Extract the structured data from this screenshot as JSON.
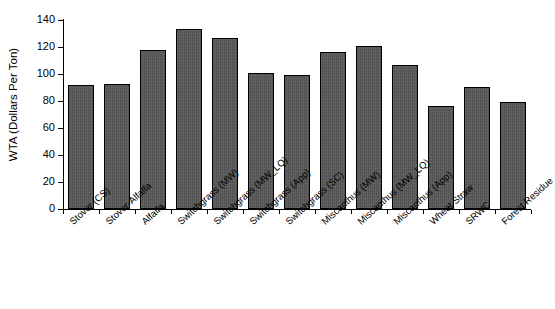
{
  "chart_data": {
    "type": "bar",
    "title": "",
    "xlabel": "",
    "ylabel": "WTA (Dollars Per Ton)",
    "ylim": [
      0,
      140
    ],
    "ytick_values": [
      0,
      20,
      40,
      60,
      80,
      100,
      120,
      140
    ],
    "ytick_labels": [
      "0",
      "20",
      "40",
      "60",
      "80",
      "100",
      "120",
      "140"
    ],
    "grid": false,
    "legend": null,
    "bar_color": "#585858",
    "bar_border_color": "#000000",
    "axis_color": "#000000",
    "categories": [
      "Stover (CS)",
      "Stover-Alfalfa",
      "Alfalfa",
      "Switchgrass (MW)",
      "Switchgrass (MW_LQ)",
      "Switchgrass (App)",
      "Switchgrass (SC)",
      "Miscanthus (MW)",
      "Miscanthus (MW_LQ)",
      "Miscanthus (App)",
      "Wheat Straw",
      "SRWC",
      "Forest Residue"
    ],
    "values": [
      92,
      92.5,
      118,
      133.5,
      126.5,
      101,
      99,
      116,
      120.5,
      106.5,
      76.5,
      90.5,
      79.5
    ]
  }
}
